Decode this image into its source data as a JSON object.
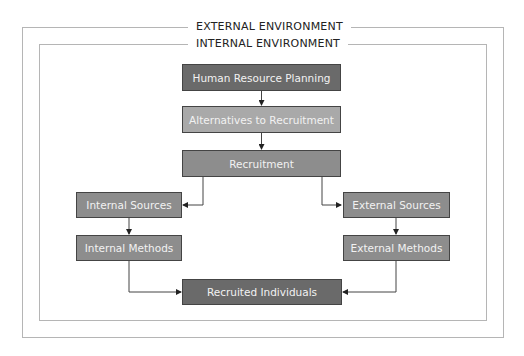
{
  "environments": {
    "external": "EXTERNAL ENVIRONMENT",
    "internal": "INTERNAL ENVIRONMENT"
  },
  "nodes": {
    "hrp": "Human Resource Planning",
    "alternatives": "Alternatives to Recruitment",
    "recruitment": "Recruitment",
    "internal_sources": "Internal Sources",
    "external_sources": "External Sources",
    "internal_methods": "Internal Methods",
    "external_methods": "External Methods",
    "recruited": "Recruited Individuals"
  },
  "edges": [
    [
      "hrp",
      "alternatives"
    ],
    [
      "alternatives",
      "recruitment"
    ],
    [
      "recruitment",
      "internal_sources"
    ],
    [
      "recruitment",
      "external_sources"
    ],
    [
      "internal_sources",
      "internal_methods"
    ],
    [
      "external_sources",
      "external_methods"
    ],
    [
      "internal_methods",
      "recruited"
    ],
    [
      "external_methods",
      "recruited"
    ]
  ],
  "colors": {
    "dark_box": "#6a6a6a",
    "mid_box": "#8d8d8d",
    "light_box": "#a9a9a9",
    "frame": "#b5b5b5"
  }
}
